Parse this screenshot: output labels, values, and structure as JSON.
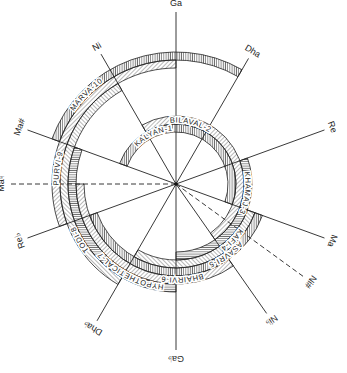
{
  "diagram": {
    "colors": {
      "ink": "#222222",
      "background": "#ffffff"
    },
    "notes": [
      {
        "id": "ga",
        "label": "Ga",
        "angle_deg": 90,
        "style": "solid"
      },
      {
        "id": "dha",
        "label": "Dha",
        "angle_deg": 60,
        "style": "solid"
      },
      {
        "id": "re",
        "label": "Re",
        "angle_deg": 20,
        "style": "solid"
      },
      {
        "id": "ma",
        "label": "Ma",
        "angle_deg": -20,
        "style": "solid"
      },
      {
        "id": "ni-sharp",
        "label": "Ni#",
        "angle_deg": -36,
        "style": "dashed"
      },
      {
        "id": "ni-flat",
        "label": "Ni♭",
        "angle_deg": -55,
        "style": "solid"
      },
      {
        "id": "ga-flat",
        "label": "Ga♭",
        "angle_deg": -90,
        "style": "solid"
      },
      {
        "id": "dha-flat",
        "label": "Dha♭",
        "angle_deg": -120,
        "style": "solid"
      },
      {
        "id": "re-flat",
        "label": "Re♭",
        "angle_deg": -160,
        "style": "solid"
      },
      {
        "id": "ma-natural-dashed",
        "label": "Ma♮",
        "angle_deg": 180,
        "style": "dashed"
      },
      {
        "id": "ma-sharp",
        "label": "Ma#",
        "angle_deg": 160,
        "style": "solid"
      },
      {
        "id": "ni",
        "label": "Ni",
        "angle_deg": 120,
        "style": "solid"
      }
    ],
    "thaats": [
      {
        "id": "kalyan",
        "label": "KALYAN-1",
        "order": 1
      },
      {
        "id": "bilaval",
        "label": "BILAVAL-2",
        "order": 2
      },
      {
        "id": "khamaj",
        "label": "KHAMAJ-3",
        "order": 3
      },
      {
        "id": "kafi",
        "label": "KAFI-4",
        "order": 4
      },
      {
        "id": "asavri",
        "label": "ASAVRI-5",
        "order": 5
      },
      {
        "id": "bhairvi",
        "label": "BHAIRVI-6",
        "order": 6
      },
      {
        "id": "hypothetical",
        "label": "HYPOTHETICAL-7",
        "order": 7
      },
      {
        "id": "todi",
        "label": "TODI-8",
        "order": 8
      },
      {
        "id": "purvi",
        "label": "PURVI-9",
        "order": 9
      },
      {
        "id": "marva",
        "label": "MARVA-10",
        "order": 10
      }
    ]
  }
}
